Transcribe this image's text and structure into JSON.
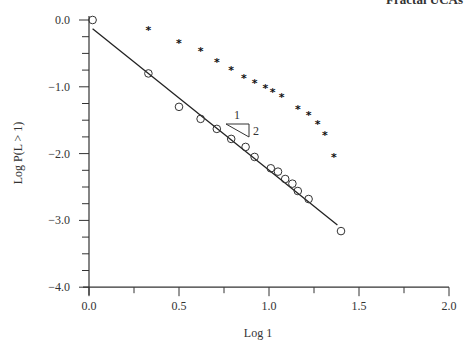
{
  "header": {
    "running_title": "Fractal UCAs"
  },
  "chart_data": {
    "type": "scatter",
    "title": "",
    "xlabel": "Log 1",
    "ylabel": "Log P(L > 1)",
    "xlim": [
      0.0,
      2.0
    ],
    "ylim": [
      -4.0,
      0.0
    ],
    "xticks": [
      "0.0",
      "0.5",
      "1.0",
      "1.5",
      "2.0"
    ],
    "yticks": [
      "0.0",
      "−1.0",
      "−2.0",
      "−3.0",
      "−4.0"
    ],
    "grid": false,
    "legend": null,
    "series": [
      {
        "name": "circles",
        "marker": "circle",
        "x": [
          0.02,
          0.33,
          0.5,
          0.62,
          0.71,
          0.79,
          0.87,
          0.92,
          1.01,
          1.05,
          1.09,
          1.13,
          1.16,
          1.22,
          1.4
        ],
        "y": [
          0.0,
          -0.8,
          -1.3,
          -1.48,
          -1.63,
          -1.78,
          -1.9,
          -2.05,
          -2.22,
          -2.27,
          -2.38,
          -2.45,
          -2.56,
          -2.68,
          -3.16
        ]
      },
      {
        "name": "stars",
        "marker": "star",
        "x": [
          0.33,
          0.5,
          0.62,
          0.71,
          0.79,
          0.86,
          0.92,
          0.98,
          1.02,
          1.07,
          1.16,
          1.22,
          1.27,
          1.31,
          1.36
        ],
        "y": [
          -0.15,
          -0.35,
          -0.46,
          -0.63,
          -0.75,
          -0.87,
          -0.95,
          -1.02,
          -1.08,
          -1.15,
          -1.33,
          -1.42,
          -1.55,
          -1.72,
          -2.05
        ]
      }
    ],
    "fit_line": {
      "x": [
        0.02,
        1.38
      ],
      "y": [
        -0.13,
        -3.07
      ],
      "slope": -2.0
    },
    "annotations": [
      {
        "type": "slope-triangle",
        "run_label": "1",
        "rise_label": "2",
        "x": 0.8,
        "y": -1.55
      }
    ]
  }
}
